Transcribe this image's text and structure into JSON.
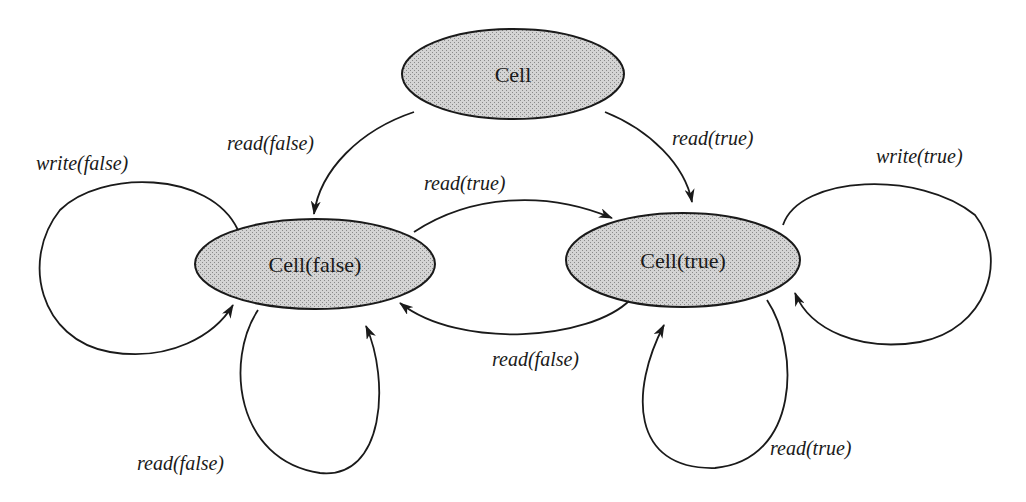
{
  "diagram": {
    "type": "state-transition-diagram",
    "colors": {
      "node_fill": "#c8c8c8",
      "stroke": "#1a1a1a",
      "background": "#ffffff"
    },
    "nodes": [
      {
        "id": "cell",
        "label": "Cell"
      },
      {
        "id": "cell_false",
        "label": "Cell(false)"
      },
      {
        "id": "cell_true",
        "label": "Cell(true)"
      }
    ],
    "edges": [
      {
        "from": "cell",
        "to": "cell_false",
        "label": "read(false)"
      },
      {
        "from": "cell",
        "to": "cell_true",
        "label": "read(true)"
      },
      {
        "from": "cell_false",
        "to": "cell_true",
        "label": "read(true)"
      },
      {
        "from": "cell_true",
        "to": "cell_false",
        "label": "read(false)"
      },
      {
        "from": "cell_false",
        "to": "cell_false",
        "label": "write(false)"
      },
      {
        "from": "cell_false",
        "to": "cell_false",
        "label": "read(false)"
      },
      {
        "from": "cell_true",
        "to": "cell_true",
        "label": "write(true)"
      },
      {
        "from": "cell_true",
        "to": "cell_true",
        "label": "read(true)"
      }
    ]
  }
}
